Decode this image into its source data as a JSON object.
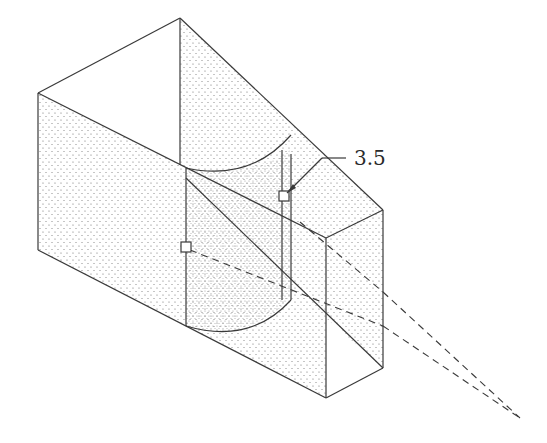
{
  "figure": {
    "type": "isometric technical drawing",
    "colors": {
      "line": "#3a3a3a",
      "stipple": "#6a6a6a",
      "background": "#ffffff"
    },
    "annotation": {
      "label": "3.5"
    },
    "markers": [
      {
        "name": "square-marker-left",
        "x": 186,
        "y": 247
      },
      {
        "name": "square-marker-right",
        "x": 284,
        "y": 196
      }
    ],
    "vanishing_point": {
      "x": 520,
      "y": 418
    }
  }
}
